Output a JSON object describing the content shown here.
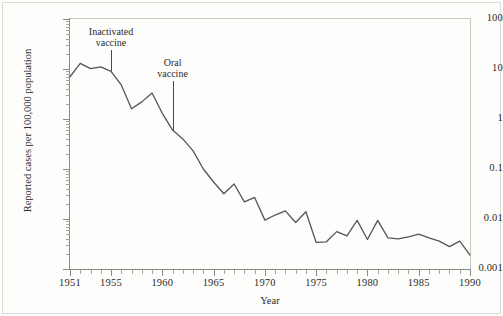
{
  "figure": {
    "background_color": "#fdfdfb",
    "line_color": "#555555",
    "axis_color": "#8a8a85",
    "text_color": "#2b2b2b"
  },
  "chart_data": {
    "type": "line",
    "title": "",
    "xlabel": "Year",
    "ylabel": "Reported cases per 100,000 population",
    "yscale": "log",
    "ylim": [
      0.001,
      100
    ],
    "xlim": [
      1951,
      1990
    ],
    "grid": false,
    "legend": null,
    "y_tick_labels": [
      "100",
      "10",
      "1",
      "0.1",
      "0.01",
      "0.001"
    ],
    "y_tick_values": [
      100,
      10,
      1,
      0.1,
      0.01,
      0.001
    ],
    "x_tick_labels": [
      "1951",
      "1955",
      "1960",
      "1965",
      "1970",
      "1975",
      "1980",
      "1985",
      "1990"
    ],
    "x_tick_values": [
      1951,
      1955,
      1960,
      1965,
      1970,
      1975,
      1980,
      1985,
      1990
    ],
    "x": [
      1951,
      1952,
      1953,
      1954,
      1955,
      1956,
      1957,
      1958,
      1959,
      1960,
      1961,
      1962,
      1963,
      1964,
      1965,
      1966,
      1967,
      1968,
      1969,
      1970,
      1971,
      1972,
      1973,
      1974,
      1975,
      1976,
      1977,
      1978,
      1979,
      1980,
      1981,
      1982,
      1983,
      1984,
      1985,
      1986,
      1987,
      1988,
      1989,
      1990
    ],
    "values": [
      7.0,
      13.0,
      10.2,
      11.0,
      9.0,
      4.8,
      1.6,
      2.2,
      3.3,
      1.3,
      0.6,
      0.4,
      0.23,
      0.1,
      0.055,
      0.032,
      0.05,
      0.022,
      0.027,
      0.0095,
      0.012,
      0.0145,
      0.0085,
      0.014,
      0.0034,
      0.0035,
      0.0056,
      0.0046,
      0.0094,
      0.0039,
      0.0094,
      0.0042,
      0.004,
      0.0044,
      0.005,
      0.0042,
      0.0036,
      0.0028,
      0.0036,
      0.0019
    ],
    "annotations": [
      {
        "label_line1": "Inactivated",
        "label_line2": "vaccine",
        "x": 1955,
        "points_to_year": 1955
      },
      {
        "label_line1": "Oral",
        "label_line2": "vaccine",
        "x": 1961,
        "points_to_year": 1961
      }
    ]
  }
}
